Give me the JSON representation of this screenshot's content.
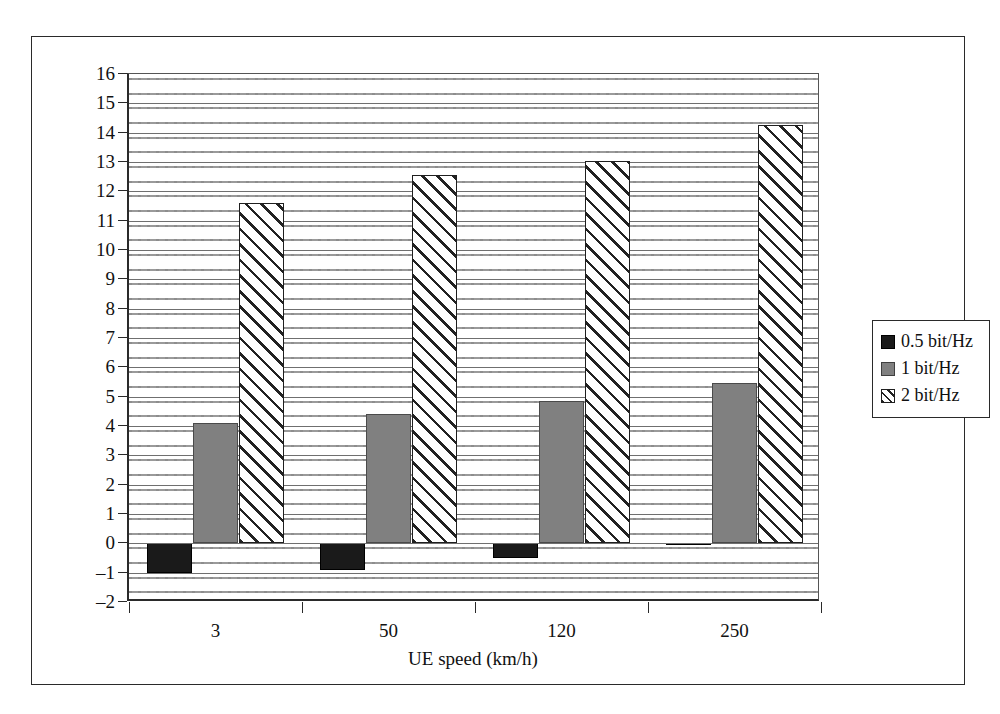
{
  "chart_data": {
    "type": "bar",
    "title": "",
    "subtitle": "",
    "xlabel": "UE speed (km/h)",
    "ylabel": "Required SNR (dB)",
    "categories": [
      "3",
      "50",
      "120",
      "250"
    ],
    "series": [
      {
        "name": "0.5 bit/Hz",
        "color": "#1a1a1a",
        "fill": "solid-black",
        "values": [
          -1.0,
          -0.9,
          -0.5,
          -0.05
        ]
      },
      {
        "name": "1 bit/Hz",
        "color": "#808080",
        "fill": "solid-gray",
        "values": [
          4.1,
          4.4,
          4.85,
          5.45
        ]
      },
      {
        "name": "2 bit/Hz",
        "color": "#ffffff",
        "fill": "diagonal-hatch",
        "values": [
          11.6,
          12.55,
          13.05,
          14.25
        ]
      }
    ],
    "ylim": [
      -2,
      16
    ],
    "ytick_step": 1,
    "yticks": [
      "16",
      "15",
      "14",
      "13",
      "12",
      "11",
      "10",
      "9",
      "8",
      "7",
      "6",
      "5",
      "4",
      "3",
      "2",
      "1",
      "0",
      "-1",
      "-2"
    ],
    "grid": true,
    "grid_orientation": "horizontal",
    "legend_position": "right",
    "plot_background": "dotted-texture"
  },
  "legend": {
    "items": [
      {
        "label": "0.5 bit/Hz",
        "swatch": "black-square-swatch"
      },
      {
        "label": "1 bit/Hz",
        "swatch": "gray-square-swatch"
      },
      {
        "label": "2 bit/Hz",
        "swatch": "hatched-square-swatch"
      }
    ]
  },
  "axes": {
    "y_title": "Required SNR (dB)",
    "x_title": "UE speed (km/h)"
  }
}
